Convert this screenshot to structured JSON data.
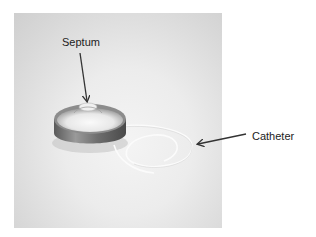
{
  "figure": {
    "labels": [
      {
        "id": "septum",
        "text": "Septum"
      },
      {
        "id": "catheter",
        "text": "Catheter"
      }
    ],
    "colors": {
      "background": "#ffffff",
      "photo_bg": "#e6e6e6",
      "port_metal": "#8a8a8a",
      "arrow": "#333333",
      "catheter": "#f8f8f8"
    }
  }
}
